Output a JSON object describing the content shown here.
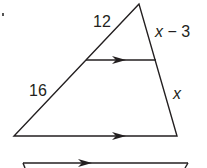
{
  "diagram": {
    "type": "triangle-proportionality",
    "labels": {
      "upper_left_segment": "12",
      "lower_left_segment": "16",
      "upper_right_segment_var": "x",
      "upper_right_segment_rest": " − 3",
      "lower_right_segment": "x"
    },
    "colors": {
      "stroke": "#231f20",
      "background": "#ffffff"
    },
    "parallel_marks": [
      "midline-arrow",
      "base-arrow",
      "next-figure-arrow"
    ]
  }
}
